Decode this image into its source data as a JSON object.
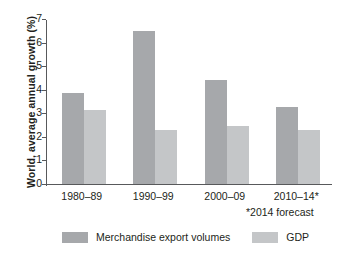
{
  "chart_data": {
    "type": "bar",
    "title": "",
    "xlabel": "",
    "ylabel": "World, average annual growth (%)",
    "categories": [
      "1980–89",
      "1990–99",
      "2000–09",
      "2010–14*"
    ],
    "series": [
      {
        "name": "Merchandise export volumes",
        "color": "#a6a8ab",
        "values": [
          3.85,
          6.5,
          4.4,
          3.25
        ]
      },
      {
        "name": "GDP",
        "color": "#c4c6c8",
        "values": [
          3.15,
          2.3,
          2.45,
          2.3
        ]
      }
    ],
    "ylim": [
      0,
      7
    ],
    "yticks": [
      0,
      1,
      2,
      3,
      4,
      5,
      6,
      7
    ],
    "ytick_labels": [
      "0",
      "1",
      "2",
      "3",
      "4",
      "5",
      "6",
      "7"
    ],
    "grid": false,
    "legend_position": "bottom",
    "annotations": [
      "*2014 forecast"
    ]
  },
  "footnote": "*2014 forecast",
  "legend": {
    "items": [
      {
        "label": "Merchandise export volumes",
        "color": "#a6a8ab"
      },
      {
        "label": "GDP",
        "color": "#c4c6c8"
      }
    ]
  },
  "colors": {
    "axis": "#58595b",
    "text": "#231f20",
    "series_dark": "#a6a8ab",
    "series_light": "#c4c6c8"
  }
}
